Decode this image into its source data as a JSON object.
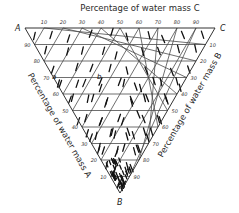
{
  "diagram": {
    "type": "ternary",
    "title_top": "Percentage of water mass C",
    "label_left": "Percentage of water mass A",
    "label_right": "Percentage of water mass B",
    "vertices": {
      "A": "A",
      "B": "B",
      "C": "C"
    },
    "ticks_top": [
      "10",
      "20",
      "30",
      "40",
      "50",
      "60",
      "70",
      "80",
      "90"
    ],
    "ticks_left": [
      "90",
      "80",
      "70",
      "60",
      "50",
      "40",
      "30",
      "20",
      "10"
    ],
    "ticks_right": [
      "10",
      "20",
      "30",
      "40",
      "50",
      "60",
      "70",
      "80",
      "90"
    ],
    "point_labels": [
      "a",
      "b"
    ],
    "grid_divisions": 10,
    "colors": {
      "ink": "#222222",
      "grid": "#4a4a4a",
      "background": "#ffffff"
    }
  }
}
